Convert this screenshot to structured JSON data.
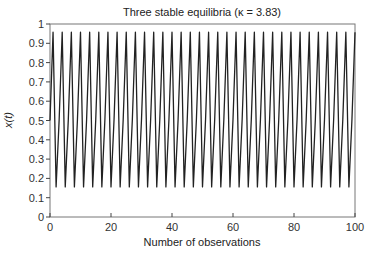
{
  "chart_data": {
    "type": "line",
    "title": "Three stable equilibria (κ = 3.83)",
    "xlabel": "Number of observations",
    "ylabel": "x(t)",
    "xlim": [
      0,
      100
    ],
    "ylim": [
      0,
      1
    ],
    "x_ticks": [
      0,
      20,
      40,
      60,
      80,
      100
    ],
    "y_ticks": [
      0,
      0.1,
      0.2,
      0.3,
      0.4,
      0.5,
      0.6,
      0.7,
      0.8,
      0.9,
      1
    ],
    "x_tick_labels": [
      "0",
      "20",
      "40",
      "60",
      "80",
      "100"
    ],
    "y_tick_labels": [
      "0",
      "0.1",
      "0.2",
      "0.3",
      "0.4",
      "0.5",
      "0.6",
      "0.7",
      "0.8",
      "0.9",
      "1"
    ],
    "grid": false,
    "legend": null,
    "model": "logistic map x(t+1) = κ x(t) (1 - x(t))",
    "kappa": 3.83,
    "x0": 0.5,
    "cycle_values": [
      0.505,
      0.957,
      0.156
    ],
    "series": [
      {
        "name": "x(t)",
        "color": "#222222",
        "x": [
          0,
          1,
          2,
          3,
          4,
          5,
          6,
          7,
          8,
          9,
          10,
          11,
          12,
          13,
          14,
          15,
          16,
          17,
          18,
          19,
          20,
          21,
          22,
          23,
          24,
          25,
          26,
          27,
          28,
          29,
          30,
          31,
          32,
          33,
          34,
          35,
          36,
          37,
          38,
          39,
          40,
          41,
          42,
          43,
          44,
          45,
          46,
          47,
          48,
          49,
          50,
          51,
          52,
          53,
          54,
          55,
          56,
          57,
          58,
          59,
          60,
          61,
          62,
          63,
          64,
          65,
          66,
          67,
          68,
          69,
          70,
          71,
          72,
          73,
          74,
          75,
          76,
          77,
          78,
          79,
          80,
          81,
          82,
          83,
          84,
          85,
          86,
          87,
          88,
          89,
          90,
          91,
          92,
          93,
          94,
          95,
          96,
          97,
          98,
          99,
          100
        ],
        "values": [
          0.5,
          0.9575,
          0.1559,
          0.5039,
          0.9574,
          0.1561,
          0.5046,
          0.9574,
          0.1561,
          0.5048,
          0.9574,
          0.1561,
          0.5049,
          0.9574,
          0.1561,
          0.5049,
          0.9574,
          0.1561,
          0.5049,
          0.9574,
          0.1561,
          0.5049,
          0.9574,
          0.1561,
          0.5049,
          0.9574,
          0.1561,
          0.5049,
          0.9574,
          0.1561,
          0.5049,
          0.9574,
          0.1561,
          0.5049,
          0.9574,
          0.1561,
          0.5049,
          0.9574,
          0.1561,
          0.5049,
          0.9574,
          0.1561,
          0.5049,
          0.9574,
          0.1561,
          0.5049,
          0.9574,
          0.1561,
          0.5049,
          0.9574,
          0.1561,
          0.5049,
          0.9574,
          0.1561,
          0.5049,
          0.9574,
          0.1561,
          0.5049,
          0.9574,
          0.1561,
          0.5049,
          0.9574,
          0.1561,
          0.5049,
          0.9574,
          0.1561,
          0.5049,
          0.9574,
          0.1561,
          0.5049,
          0.9574,
          0.1561,
          0.5049,
          0.9574,
          0.1561,
          0.5049,
          0.9574,
          0.1561,
          0.5049,
          0.9574,
          0.1561,
          0.5049,
          0.9574,
          0.1561,
          0.5049,
          0.9574,
          0.1561,
          0.5049,
          0.9574,
          0.1561,
          0.5049,
          0.9574,
          0.1561,
          0.5049,
          0.9574,
          0.1561,
          0.5049,
          0.9574,
          0.1561,
          0.5049,
          0.9574
        ]
      }
    ]
  },
  "layout": {
    "plot_left": 50,
    "plot_right": 355,
    "plot_top": 24,
    "plot_bottom": 217,
    "axis_color": "#444444",
    "frame_color": "#777777"
  }
}
